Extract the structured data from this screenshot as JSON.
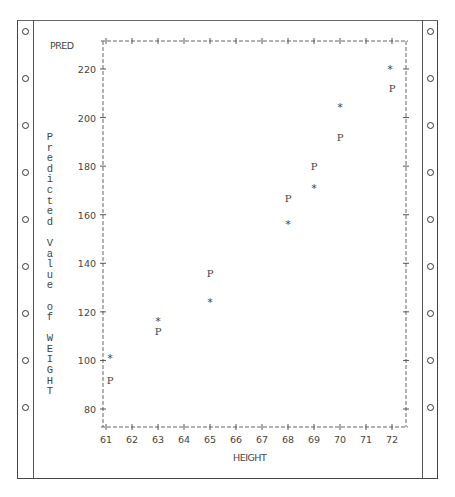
{
  "chart_data": {
    "type": "scatter",
    "title": "",
    "plot_label": "PRED",
    "xlabel": "HEIGHT",
    "ylabel": "Predicted Value of WEIGHT",
    "xlim": [
      61,
      72
    ],
    "ylim": [
      80,
      220
    ],
    "x_ticks": [
      "61",
      "62",
      "63",
      "64",
      "65",
      "66",
      "67",
      "68",
      "69",
      "70",
      "71",
      "72"
    ],
    "y_ticks": [
      "80",
      "100",
      "120",
      "140",
      "160",
      "180",
      "200",
      "220"
    ],
    "grid": false,
    "legend": null,
    "series": [
      {
        "name": "Observed (*)",
        "marker": "*",
        "x": [
          61,
          63,
          65,
          68,
          69,
          70,
          72
        ],
        "y": [
          102,
          117,
          125,
          157,
          172,
          205,
          221
        ]
      },
      {
        "name": "Predicted (P)",
        "marker": "P",
        "x": [
          61,
          63,
          65,
          68,
          69,
          70,
          72
        ],
        "y": [
          92,
          112,
          136,
          167,
          180,
          192,
          212
        ]
      }
    ]
  },
  "labels": {
    "pred": "PRED",
    "xlabel": "HEIGHT",
    "ylabel_vertical": "P\nr\ne\nd\ni\nc\nt\ne\nd\n \nV\na\nl\nu\ne\n \no\nf\n \nW\nE\nI\nG\nH\nT",
    "star": "*",
    "p": "P"
  }
}
